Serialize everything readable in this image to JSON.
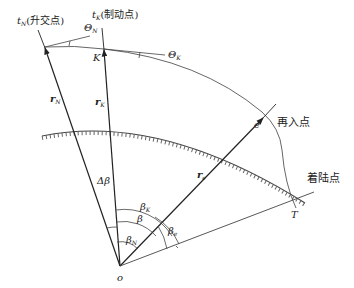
{
  "diagram": {
    "points": {
      "ascending_node": {
        "symbol": "t",
        "subscript": "N",
        "label": "(升交点)"
      },
      "braking_point": {
        "symbol": "t",
        "subscript": "K",
        "label": "(制动点)"
      },
      "K_point": "K",
      "reentry_point": {
        "symbol": "e",
        "label": "再入点"
      },
      "landing_point": {
        "symbol": "T",
        "label": "着陆点"
      },
      "origin": "o"
    },
    "vectors": {
      "r_N": {
        "symbol": "r",
        "subscript": "N"
      },
      "r_K": {
        "symbol": "r",
        "subscript": "K"
      },
      "r_e": {
        "symbol": "r",
        "subscript": "e"
      }
    },
    "angles": {
      "theta_N": {
        "symbol": "Θ",
        "subscript": "N"
      },
      "theta_K": {
        "symbol": "Θ",
        "subscript": "K"
      },
      "delta_beta": "Δβ",
      "beta": "β",
      "beta_K": {
        "symbol": "β",
        "subscript": "K"
      },
      "beta_N": {
        "symbol": "β",
        "subscript": "N"
      },
      "beta_e": {
        "symbol": "β",
        "subscript": "e"
      }
    },
    "colors": {
      "line": "#333333",
      "light_line": "#555555",
      "text": "#222222"
    }
  }
}
